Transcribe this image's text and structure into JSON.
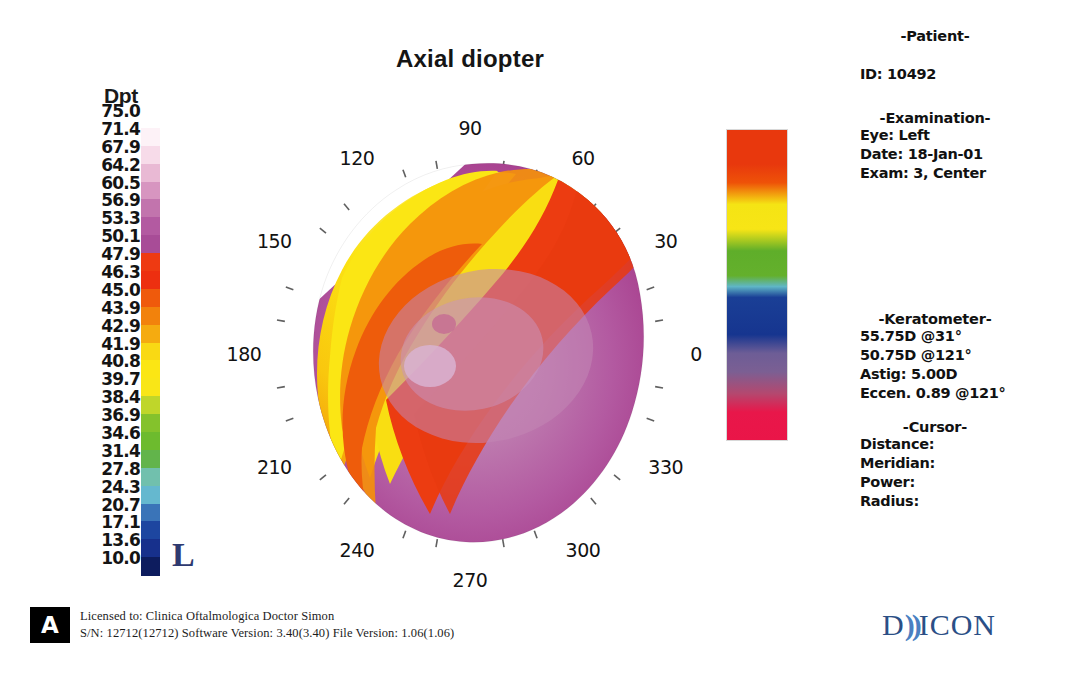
{
  "map": {
    "title": "Axial diopter",
    "eye_marker": "L",
    "angle_labels": [
      "0",
      "30",
      "60",
      "90",
      "120",
      "150",
      "180",
      "210",
      "240",
      "270",
      "300",
      "330"
    ]
  },
  "scale": {
    "header": "Dpt",
    "unit": "Dpt",
    "values": [
      "75.0",
      "71.4",
      "67.9",
      "64.2",
      "60.5",
      "56.9",
      "53.3",
      "50.1",
      "47.9",
      "46.3",
      "45.0",
      "43.9",
      "42.9",
      "41.9",
      "40.8",
      "39.7",
      "38.4",
      "36.9",
      "34.6",
      "31.4",
      "27.8",
      "24.3",
      "20.7",
      "17.1",
      "13.6",
      "10.0"
    ],
    "colors": [
      "#ffffff",
      "#fdf2f7",
      "#f7dbe9",
      "#e9b9d4",
      "#d795c0",
      "#c274ad",
      "#b35aa1",
      "#a84c97",
      "#ee3a12",
      "#ed2f10",
      "#ef5a0c",
      "#f2820c",
      "#f5ab10",
      "#f9d914",
      "#fbe614",
      "#f9e617",
      "#bfd62a",
      "#84c22c",
      "#6dbb2e",
      "#62b44b",
      "#71c0ad",
      "#65b8cf",
      "#3a74b8",
      "#1d46a0",
      "#17308c",
      "#0d1c5e"
    ]
  },
  "patient": {
    "section_title": "-Patient-",
    "id_label": "ID: 10492"
  },
  "examination": {
    "section_title": "-Examination-",
    "eye": "Eye: Left",
    "date": "Date: 18-Jan-01",
    "exam": "Exam: 3, Center"
  },
  "keratometer": {
    "section_title": "-Keratometer-",
    "k1": "55.75D @31°",
    "k2": "50.75D @121°",
    "astig": "Astig: 5.00D",
    "eccen": "Eccen. 0.89 @121°"
  },
  "cursor": {
    "section_title": "-Cursor-",
    "distance": "Distance:",
    "meridian": "Meridian:",
    "power": "Power:",
    "radius": "Radius:"
  },
  "footer": {
    "badge": "A",
    "license": "Licensed to: Clinica Oftalmologica Doctor Simon",
    "versions": "S/N: 12712(12712)   Software Version: 3.40(3.40)   File Version: 1.06(1.06)",
    "brand_pre": "D",
    "brand_wave": "))",
    "brand_post": "ICON"
  },
  "chart_data": {
    "type": "heatmap",
    "title": "Axial diopter",
    "subtype": "corneal-topography-polar-map",
    "unit": "Diopters",
    "eye": "Left",
    "angle_ticks": [
      0,
      10,
      20,
      30,
      40,
      50,
      60,
      70,
      80,
      90,
      100,
      110,
      120,
      130,
      140,
      150,
      160,
      170,
      180,
      190,
      200,
      210,
      220,
      230,
      240,
      250,
      260,
      270,
      280,
      290,
      300,
      310,
      320,
      330,
      340,
      350
    ],
    "angle_labels": [
      0,
      30,
      60,
      90,
      120,
      150,
      180,
      210,
      240,
      270,
      300,
      330
    ],
    "colorbar": {
      "label": "Dpt",
      "ticks": [
        75.0,
        71.4,
        67.9,
        64.2,
        60.5,
        56.9,
        53.3,
        50.1,
        47.9,
        46.3,
        45.0,
        43.9,
        42.9,
        41.9,
        40.8,
        39.7,
        38.4,
        36.9,
        34.6,
        31.4,
        27.8,
        24.3,
        20.7,
        17.1,
        13.6,
        10.0
      ],
      "min": 10.0,
      "max": 75.0
    },
    "regions": [
      {
        "name": "inferior-temporal-steep-zone",
        "approx_diopters": [
          53.3,
          60.5
        ],
        "color": "#b35aa1",
        "angle_range_deg": [
          250,
          60
        ],
        "description": "large magenta/purple steep region covering inferior and nasal cornea"
      },
      {
        "name": "central-apex",
        "approx_diopters": [
          53.3,
          56.9
        ],
        "color": "#c274ad",
        "angle_range_deg": [
          0,
          360
        ],
        "description": "lighter washed central zone near apex"
      },
      {
        "name": "superior-transition-red",
        "approx_diopters": [
          46.3,
          50.1
        ],
        "color": "#ee3a12",
        "angle_range_deg": [
          40,
          170
        ],
        "description": "red transition band along superior-nasal boundary"
      },
      {
        "name": "superior-orange-band",
        "approx_diopters": [
          43.9,
          45.0
        ],
        "color": "#f2820c",
        "angle_range_deg": [
          120,
          180
        ],
        "description": "orange band"
      },
      {
        "name": "superior-flat-yellow",
        "approx_diopters": [
          40.8,
          42.9
        ],
        "color": "#fbe614",
        "angle_range_deg": [
          95,
          175
        ],
        "description": "yellow flat superior-temporal zone"
      }
    ],
    "keratometry": {
      "k1_D": 55.75,
      "k1_axis_deg": 31,
      "k2_D": 50.75,
      "k2_axis_deg": 121,
      "astigmatism_D": 5.0,
      "eccentricity": 0.89,
      "eccentricity_axis_deg": 121
    }
  }
}
